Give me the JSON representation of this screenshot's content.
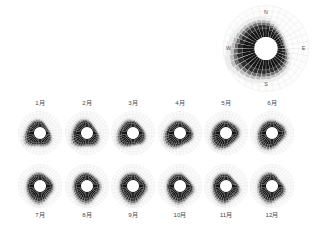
{
  "figure": {
    "title": "",
    "background_color": "#ffffff",
    "petal_dark_color": "#1d1d1d",
    "petal_light_color": "#f2f2f2",
    "grid_color": "#cfcfcf",
    "label_color": "#4a4a4a"
  },
  "overview": {
    "name": "annual-wind-rose",
    "center_x": 266,
    "center_y": 48.5,
    "outer_radius": 43,
    "hub_radius": 11.5,
    "compass": {
      "north": "N",
      "east": "E",
      "south": "S",
      "west": "W"
    }
  },
  "small_multiples": {
    "columns": 6,
    "rows": 2,
    "rose_radius": 21.5,
    "hub_radius": 5.8,
    "row1_center_y": 133,
    "row2_center_y": 186,
    "row1_label_y": 105,
    "row2_label_y": 217,
    "centers_x": [
      40,
      87,
      133,
      180,
      226,
      272
    ]
  },
  "chart_data": {
    "type": "windrose",
    "title": "",
    "xlabel": "",
    "ylabel": "",
    "sector_count": 36,
    "sector_width_degrees": 10,
    "direction_start_degrees": 0,
    "panels": [
      {
        "id": "annual",
        "label": "",
        "is_overview": true,
        "values": [
          0.62,
          0.55,
          0.48,
          0.42,
          0.38,
          0.36,
          0.34,
          0.33,
          0.35,
          0.4,
          0.46,
          0.52,
          0.58,
          0.63,
          0.66,
          0.68,
          0.7,
          0.72,
          0.74,
          0.78,
          0.82,
          0.86,
          0.9,
          0.95,
          1.0,
          0.97,
          0.92,
          0.88,
          0.84,
          0.8,
          0.76,
          0.74,
          0.72,
          0.7,
          0.68,
          0.65
        ]
      },
      {
        "id": "m1",
        "label": "1月",
        "is_overview": false,
        "values": [
          0.58,
          0.5,
          0.42,
          0.36,
          0.32,
          0.3,
          0.3,
          0.33,
          0.38,
          0.44,
          0.52,
          0.6,
          0.66,
          0.7,
          0.72,
          0.7,
          0.66,
          0.62,
          0.6,
          0.64,
          0.72,
          0.82,
          0.92,
          1.0,
          0.96,
          0.88,
          0.8,
          0.74,
          0.7,
          0.68,
          0.66,
          0.66,
          0.68,
          0.68,
          0.66,
          0.62
        ]
      },
      {
        "id": "m2",
        "label": "2月",
        "is_overview": false,
        "values": [
          0.6,
          0.52,
          0.44,
          0.38,
          0.34,
          0.32,
          0.32,
          0.36,
          0.42,
          0.5,
          0.58,
          0.66,
          0.72,
          0.76,
          0.76,
          0.72,
          0.66,
          0.62,
          0.62,
          0.68,
          0.78,
          0.88,
          0.96,
          1.0,
          0.94,
          0.86,
          0.8,
          0.76,
          0.72,
          0.7,
          0.7,
          0.7,
          0.72,
          0.72,
          0.7,
          0.66
        ]
      },
      {
        "id": "m3",
        "label": "3月",
        "is_overview": false,
        "values": [
          0.56,
          0.5,
          0.46,
          0.42,
          0.4,
          0.4,
          0.42,
          0.46,
          0.52,
          0.58,
          0.64,
          0.68,
          0.7,
          0.7,
          0.66,
          0.6,
          0.56,
          0.56,
          0.6,
          0.68,
          0.78,
          0.88,
          0.96,
          1.0,
          0.96,
          0.9,
          0.84,
          0.78,
          0.74,
          0.7,
          0.68,
          0.68,
          0.7,
          0.7,
          0.66,
          0.6
        ]
      },
      {
        "id": "m4",
        "label": "4月",
        "is_overview": false,
        "values": [
          0.54,
          0.5,
          0.48,
          0.46,
          0.46,
          0.48,
          0.52,
          0.56,
          0.6,
          0.64,
          0.66,
          0.66,
          0.64,
          0.6,
          0.56,
          0.54,
          0.56,
          0.62,
          0.7,
          0.8,
          0.88,
          0.94,
          0.98,
          1.0,
          0.96,
          0.9,
          0.84,
          0.78,
          0.72,
          0.68,
          0.64,
          0.62,
          0.62,
          0.62,
          0.6,
          0.56
        ]
      },
      {
        "id": "m5",
        "label": "5月",
        "is_overview": false,
        "values": [
          0.56,
          0.54,
          0.52,
          0.52,
          0.54,
          0.58,
          0.62,
          0.66,
          0.68,
          0.68,
          0.66,
          0.62,
          0.58,
          0.56,
          0.56,
          0.6,
          0.66,
          0.74,
          0.82,
          0.9,
          0.96,
          1.0,
          0.98,
          0.94,
          0.88,
          0.82,
          0.76,
          0.72,
          0.68,
          0.64,
          0.62,
          0.6,
          0.6,
          0.6,
          0.58,
          0.56
        ]
      },
      {
        "id": "m6",
        "label": "6月",
        "is_overview": false,
        "values": [
          0.6,
          0.58,
          0.56,
          0.56,
          0.58,
          0.62,
          0.66,
          0.7,
          0.72,
          0.7,
          0.66,
          0.62,
          0.58,
          0.56,
          0.58,
          0.64,
          0.72,
          0.8,
          0.88,
          0.94,
          0.98,
          1.0,
          0.96,
          0.9,
          0.84,
          0.78,
          0.74,
          0.7,
          0.66,
          0.64,
          0.62,
          0.62,
          0.62,
          0.62,
          0.62,
          0.6
        ]
      },
      {
        "id": "m7",
        "label": "7月",
        "is_overview": false,
        "values": [
          0.62,
          0.58,
          0.54,
          0.52,
          0.52,
          0.54,
          0.58,
          0.62,
          0.66,
          0.68,
          0.68,
          0.66,
          0.64,
          0.64,
          0.68,
          0.76,
          0.86,
          0.94,
          1.0,
          0.98,
          0.92,
          0.86,
          0.8,
          0.76,
          0.72,
          0.7,
          0.68,
          0.66,
          0.66,
          0.66,
          0.66,
          0.66,
          0.66,
          0.66,
          0.66,
          0.64
        ]
      },
      {
        "id": "m8",
        "label": "8月",
        "is_overview": false,
        "values": [
          0.64,
          0.6,
          0.56,
          0.54,
          0.54,
          0.56,
          0.6,
          0.64,
          0.68,
          0.7,
          0.7,
          0.68,
          0.66,
          0.66,
          0.7,
          0.78,
          0.88,
          0.96,
          1.0,
          0.98,
          0.94,
          0.88,
          0.82,
          0.78,
          0.74,
          0.72,
          0.7,
          0.68,
          0.68,
          0.68,
          0.68,
          0.68,
          0.68,
          0.68,
          0.68,
          0.66
        ]
      },
      {
        "id": "m9",
        "label": "9月",
        "is_overview": false,
        "values": [
          0.62,
          0.58,
          0.54,
          0.52,
          0.5,
          0.52,
          0.56,
          0.62,
          0.68,
          0.72,
          0.74,
          0.72,
          0.7,
          0.7,
          0.74,
          0.82,
          0.92,
          0.98,
          1.0,
          0.96,
          0.9,
          0.84,
          0.78,
          0.74,
          0.72,
          0.7,
          0.68,
          0.66,
          0.66,
          0.66,
          0.66,
          0.66,
          0.66,
          0.66,
          0.64,
          0.62
        ]
      },
      {
        "id": "m10",
        "label": "10月",
        "is_overview": false,
        "values": [
          0.6,
          0.54,
          0.48,
          0.44,
          0.42,
          0.42,
          0.46,
          0.52,
          0.6,
          0.68,
          0.74,
          0.76,
          0.74,
          0.72,
          0.72,
          0.78,
          0.86,
          0.94,
          1.0,
          0.98,
          0.92,
          0.86,
          0.8,
          0.74,
          0.7,
          0.68,
          0.66,
          0.64,
          0.64,
          0.64,
          0.64,
          0.64,
          0.64,
          0.64,
          0.62,
          0.6
        ]
      },
      {
        "id": "m11",
        "label": "11月",
        "is_overview": false,
        "values": [
          0.58,
          0.52,
          0.46,
          0.4,
          0.38,
          0.38,
          0.42,
          0.48,
          0.56,
          0.64,
          0.72,
          0.76,
          0.76,
          0.74,
          0.72,
          0.74,
          0.8,
          0.9,
          0.98,
          1.0,
          0.96,
          0.9,
          0.84,
          0.78,
          0.74,
          0.7,
          0.68,
          0.66,
          0.66,
          0.66,
          0.66,
          0.66,
          0.66,
          0.66,
          0.64,
          0.6
        ]
      },
      {
        "id": "m12",
        "label": "12月",
        "is_overview": false,
        "values": [
          0.58,
          0.5,
          0.44,
          0.38,
          0.34,
          0.34,
          0.36,
          0.42,
          0.5,
          0.58,
          0.66,
          0.72,
          0.74,
          0.74,
          0.72,
          0.72,
          0.76,
          0.86,
          0.96,
          1.0,
          0.96,
          0.9,
          0.86,
          0.82,
          0.78,
          0.74,
          0.72,
          0.7,
          0.7,
          0.7,
          0.7,
          0.7,
          0.7,
          0.7,
          0.68,
          0.64
        ]
      }
    ]
  }
}
